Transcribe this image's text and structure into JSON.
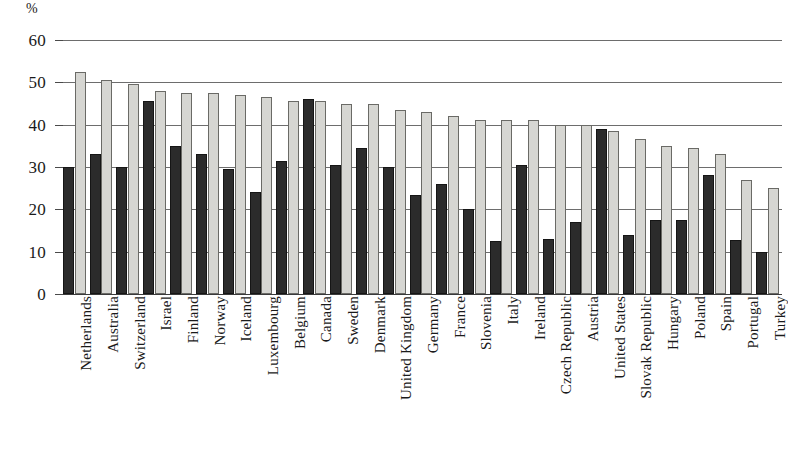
{
  "chart_data": {
    "type": "bar",
    "title": "",
    "subtitle": "",
    "xlabel": "",
    "ylabel": "%",
    "ylim": [
      0,
      60
    ],
    "y_ticks": [
      0,
      10,
      20,
      30,
      40,
      50,
      60
    ],
    "y_tick_labels": [
      "0",
      "10",
      "20",
      "30",
      "40",
      "50",
      "60"
    ],
    "grid": true,
    "legend_position": "none",
    "orientation": "vertical",
    "grouping": "grouped",
    "categories": [
      "Netherlands",
      "Australia",
      "Switzerland",
      "Israel",
      "Finland",
      "Norway",
      "Iceland",
      "Luxembourg",
      "Belgium",
      "Canada",
      "Sweden",
      "Denmark",
      "United Kingdom",
      "Germany",
      "France",
      "Slovenia",
      "Italy",
      "Ireland",
      "Czech Republic",
      "Austria",
      "United States",
      "Slovak Republic",
      "Hungary",
      "Poland",
      "Spain",
      "Portugal",
      "Turkey"
    ],
    "series": [
      {
        "name": "series-dark",
        "color": "#2b2b2b",
        "values": [
          30.0,
          33.0,
          30.0,
          45.5,
          35.0,
          33.0,
          29.5,
          24.0,
          31.5,
          46.0,
          30.5,
          34.5,
          30.0,
          23.5,
          26.0,
          20.0,
          12.5,
          30.5,
          13.0,
          17.0,
          39.0,
          14.0,
          17.5,
          17.5,
          28.0,
          12.7,
          10.0
        ]
      },
      {
        "name": "series-light",
        "color": "#d6d6d2",
        "values": [
          52.5,
          50.5,
          49.5,
          48.0,
          47.5,
          47.5,
          47.0,
          46.5,
          45.5,
          45.5,
          45.0,
          45.0,
          43.5,
          43.0,
          42.0,
          41.0,
          41.0,
          41.0,
          40.0,
          40.0,
          38.5,
          36.5,
          35.0,
          34.5,
          33.0,
          27.0,
          25.0
        ]
      }
    ]
  },
  "colors": {
    "dark_bar": "#2b2b2b",
    "light_bar": "#d6d6d2",
    "light_bar_border": "#6a6a66",
    "gridline": "#6d6d6d",
    "axis": "#3a3a3a",
    "text": "#1a1a1a",
    "background": "#ffffff"
  }
}
